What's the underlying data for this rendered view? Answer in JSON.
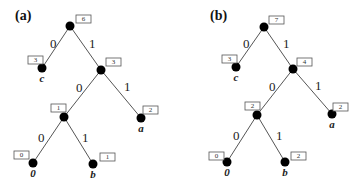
{
  "panels": [
    {
      "title": "(a)",
      "nodes": [
        {
          "id": "root",
          "x": 70,
          "y": 26,
          "weight": "6",
          "box": [
            76,
            15
          ]
        },
        {
          "id": "c",
          "x": 42,
          "y": 68,
          "weight": "3",
          "box": [
            28,
            56
          ],
          "label": "c"
        },
        {
          "id": "n3",
          "x": 101,
          "y": 70,
          "weight": "3",
          "box": [
            106,
            58
          ]
        },
        {
          "id": "n1",
          "x": 64,
          "y": 117,
          "weight": "1",
          "box": [
            51,
            104
          ]
        },
        {
          "id": "a",
          "x": 141,
          "y": 118,
          "weight": "2",
          "box": [
            143,
            106
          ],
          "label": "a"
        },
        {
          "id": "z",
          "x": 33,
          "y": 163,
          "weight": "0",
          "box": [
            14,
            151
          ],
          "label": "0"
        },
        {
          "id": "b",
          "x": 93,
          "y": 164,
          "weight": "1",
          "box": [
            100,
            153
          ],
          "label": "b"
        }
      ],
      "edges": [
        {
          "from": "root",
          "to": "c",
          "label": "0",
          "lx": 50,
          "ly": 48
        },
        {
          "from": "root",
          "to": "n3",
          "label": "1",
          "lx": 89,
          "ly": 48
        },
        {
          "from": "n3",
          "to": "n1",
          "label": "0",
          "lx": 76,
          "ly": 92
        },
        {
          "from": "n3",
          "to": "a",
          "label": "1",
          "lx": 124,
          "ly": 91
        },
        {
          "from": "n1",
          "to": "z",
          "label": "0",
          "lx": 38,
          "ly": 142
        },
        {
          "from": "n1",
          "to": "b",
          "label": "1",
          "lx": 82,
          "ly": 142
        }
      ]
    },
    {
      "title": "(b)",
      "nodes": [
        {
          "id": "root",
          "x": 264,
          "y": 27,
          "weight": "7",
          "box": [
            269,
            16
          ]
        },
        {
          "id": "c",
          "x": 236,
          "y": 67,
          "weight": "3",
          "box": [
            222,
            55
          ],
          "label": "c"
        },
        {
          "id": "n4",
          "x": 293,
          "y": 69,
          "weight": "4",
          "box": [
            297,
            58
          ]
        },
        {
          "id": "n2",
          "x": 257,
          "y": 115,
          "weight": "2",
          "box": [
            245,
            102
          ]
        },
        {
          "id": "a",
          "x": 332,
          "y": 114,
          "weight": "2",
          "box": [
            333,
            103
          ],
          "label": "a"
        },
        {
          "id": "z",
          "x": 227,
          "y": 162,
          "weight": "0",
          "box": [
            209,
            152
          ],
          "label": "0"
        },
        {
          "id": "b",
          "x": 285,
          "y": 162,
          "weight": "2",
          "box": [
            291,
            152
          ],
          "label": "b"
        }
      ],
      "edges": [
        {
          "from": "root",
          "to": "c",
          "label": "0",
          "lx": 243,
          "ly": 48
        },
        {
          "from": "root",
          "to": "n4",
          "label": "1",
          "lx": 283,
          "ly": 48
        },
        {
          "from": "n4",
          "to": "n2",
          "label": "0",
          "lx": 269,
          "ly": 91
        },
        {
          "from": "n4",
          "to": "a",
          "label": "1",
          "lx": 315,
          "ly": 90
        },
        {
          "from": "n2",
          "to": "z",
          "label": "0",
          "lx": 233,
          "ly": 140
        },
        {
          "from": "n2",
          "to": "b",
          "label": "1",
          "lx": 276,
          "ly": 140
        }
      ]
    }
  ],
  "title_positions": [
    [
      15,
      20
    ],
    [
      210,
      20
    ]
  ]
}
